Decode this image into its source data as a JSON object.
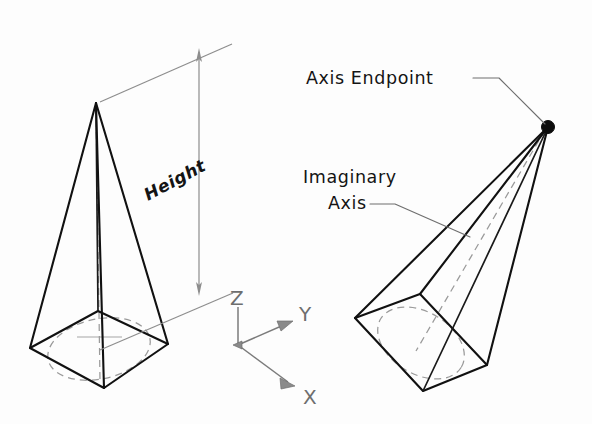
{
  "figure": {
    "background_color": "#fdfdfd",
    "line_color": "#111111",
    "construction_color": "#9a9a9a",
    "dimension_color": "#8d8d8d",
    "axis_color": "#7b7b7b",
    "endpoint_color": "#0c0c0c"
  },
  "labels": {
    "height": "Height",
    "axis_endpoint": "Axis Endpoint",
    "imaginary_line1": "Imaginary",
    "imaginary_line2": "Axis"
  },
  "coordinate_axes": {
    "z": "Z",
    "y": "Y",
    "x": "X"
  },
  "objects": {
    "left_pyramid": {
      "name": "upright-square-pyramid",
      "apex": [
        96,
        103
      ],
      "base_corners": [
        [
          30,
          348
        ],
        [
          98,
          311
        ],
        [
          168,
          344
        ],
        [
          104,
          388
        ]
      ],
      "base_center": [
        99,
        348
      ],
      "has_center_axis": true,
      "has_inscribed_circle": true
    },
    "right_pyramid": {
      "name": "tilted-square-pyramid",
      "apex": [
        548,
        127
      ],
      "base_corners": [
        [
          355,
          318
        ],
        [
          420,
          294
        ],
        [
          487,
          365
        ],
        [
          423,
          391
        ]
      ],
      "base_center": [
        421,
        342
      ],
      "has_center_axis": true,
      "has_inscribed_circle": true
    }
  },
  "dimension": {
    "name": "height-dimension",
    "line_x": 199,
    "top_y": 48,
    "bottom_y": 296,
    "text_rotation_deg": -28
  }
}
